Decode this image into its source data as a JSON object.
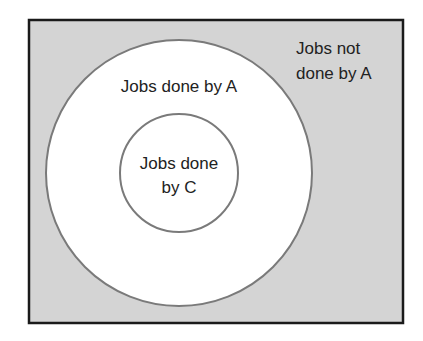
{
  "diagram": {
    "type": "venn-nested",
    "regions": {
      "universe": {
        "label_line1": "Jobs not",
        "label_line2": "done by A"
      },
      "outer_set": {
        "label": "Jobs done by A"
      },
      "inner_set": {
        "label_line1": "Jobs done",
        "label_line2": "by C"
      }
    },
    "colors": {
      "universe_fill": "#d4d4d4",
      "border": "#1a1a1a",
      "circle_stroke": "#7a7a7a",
      "circle_fill": "#ffffff",
      "text": "#222222"
    }
  }
}
